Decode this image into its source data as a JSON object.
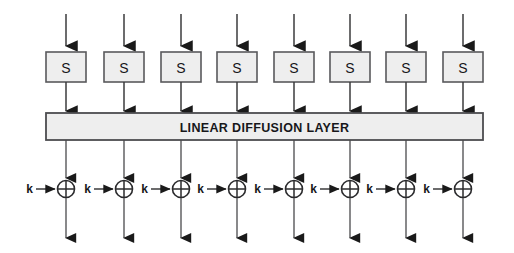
{
  "diagram": {
    "canvas": {
      "width": 514,
      "height": 253,
      "background": "#ffffff"
    },
    "colors": {
      "box_fill": "#eeeeee",
      "box_stroke": "#59595c",
      "bar_fill": "#eeeeee",
      "bar_stroke": "#4c4c4f",
      "wire": "#3b3b3d",
      "text": "#17171a",
      "xor_stroke": "#2b2b2d"
    },
    "lane_count": 8,
    "lanes": [
      {
        "index": 1,
        "x": 66,
        "sbox_label": "S",
        "key_label": "k"
      },
      {
        "index": 2,
        "x": 124,
        "sbox_label": "S",
        "key_label": "k"
      },
      {
        "index": 3,
        "x": 181,
        "sbox_label": "S",
        "key_label": "k"
      },
      {
        "index": 4,
        "x": 237,
        "sbox_label": "S",
        "key_label": "k"
      },
      {
        "index": 5,
        "x": 294,
        "sbox_label": "S",
        "key_label": "k"
      },
      {
        "index": 6,
        "x": 350,
        "sbox_label": "S",
        "key_label": "k"
      },
      {
        "index": 7,
        "x": 406,
        "sbox_label": "S",
        "key_label": "k"
      },
      {
        "index": 8,
        "x": 463,
        "sbox_label": "S",
        "key_label": "k"
      }
    ],
    "geometry": {
      "input_arrow_top": 14,
      "sbox_top": 52,
      "sbox_bottom": 82,
      "sbox_width": 40,
      "sbox_height": 30,
      "bar_left": 46,
      "bar_right": 483,
      "bar_top": 113,
      "bar_bottom": 140,
      "xor_center_y": 189,
      "xor_radius": 8.5,
      "key_arrow_length": 16,
      "output_arrow_bottom": 241
    },
    "substitution_layer": {
      "name": "substitution-layer",
      "box_label": "S",
      "box_count": 8
    },
    "diffusion_layer": {
      "name": "linear-diffusion-layer",
      "label": "LINEAR DIFFUSION LAYER"
    },
    "key_addition_layer": {
      "name": "key-addition-layer",
      "key_label": "k",
      "operator_symbol": "⊕",
      "operator_name": "xor",
      "count": 8
    }
  }
}
